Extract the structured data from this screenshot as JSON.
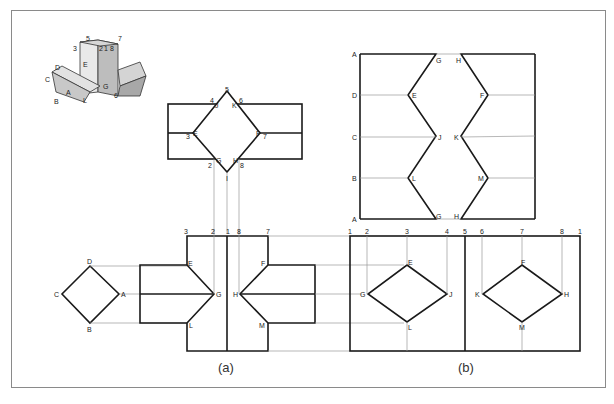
{
  "figure": {
    "captions": {
      "a": "(a)",
      "b": "(b)"
    },
    "pictorial": {
      "labels": [
        "3",
        "5",
        "2",
        "1",
        "8",
        "7",
        "D",
        "C",
        "E",
        "G",
        "A",
        "B",
        "L",
        "6"
      ]
    },
    "top_view": {
      "corners": {
        "top": "5",
        "left": "3",
        "right": "7",
        "bottom": "I"
      },
      "labels": {
        "n4": "4",
        "J": "J",
        "K": "K",
        "n6": "6",
        "E": "E",
        "F": "F",
        "G": "G",
        "H": "H",
        "n2": "2",
        "n8": "8"
      }
    },
    "end_view": {
      "A": "A",
      "B": "B",
      "C": "C",
      "D": "D"
    },
    "front_view": {
      "top_numbers": [
        "3",
        "2",
        "1",
        "8",
        "7"
      ],
      "points": {
        "E": "E",
        "F": "F",
        "G": "G",
        "H": "H",
        "L": "L",
        "M": "M"
      }
    },
    "development_horizontal": {
      "left_labels": [
        "A",
        "D",
        "C",
        "B",
        "A"
      ],
      "zigzag_left": [
        "G",
        "E",
        "J",
        "L",
        "G"
      ],
      "zigzag_right": [
        "H",
        "F",
        "K",
        "M",
        "H"
      ]
    },
    "development_vertical": {
      "top_numbers": [
        "1",
        "2",
        "3",
        "4",
        "5",
        "6",
        "7",
        "8",
        "1"
      ],
      "left_diamond": {
        "top": "E",
        "left": "G",
        "right": "J",
        "bottom": "L"
      },
      "right_diamond": {
        "top": "F",
        "left": "K",
        "right": "H",
        "bottom": "M"
      }
    }
  }
}
